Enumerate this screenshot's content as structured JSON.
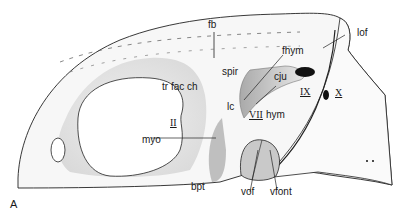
{
  "figure": {
    "panel_label": "A",
    "labels": {
      "fb": "fb",
      "fhym": "fhym",
      "lof": "lof",
      "spir": "spir",
      "cju": "cju",
      "tr_fac_ch": "tr fac ch",
      "lc": "lc",
      "IX": "IX",
      "X": "X",
      "II": "II",
      "VII": "VII",
      "hym": "hym",
      "myo": "myo",
      "bpt": "bpt",
      "vof": "vof",
      "vfont": "vfont"
    }
  }
}
